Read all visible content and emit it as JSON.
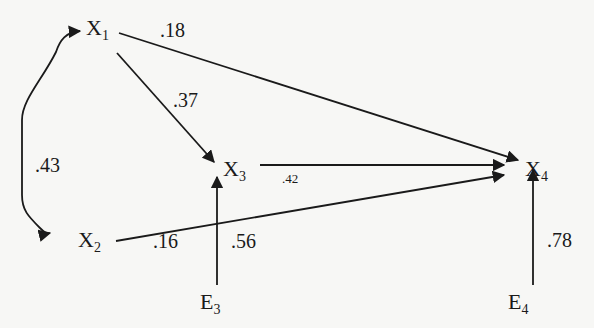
{
  "diagram": {
    "type": "path-diagram",
    "nodes": [
      {
        "id": "X1",
        "base": "X",
        "sub": "1"
      },
      {
        "id": "X2",
        "base": "X",
        "sub": "2"
      },
      {
        "id": "X3",
        "base": "X",
        "sub": "3"
      },
      {
        "id": "X4",
        "base": "X",
        "sub": "4"
      },
      {
        "id": "E3",
        "base": "E",
        "sub": "3"
      },
      {
        "id": "E4",
        "base": "E",
        "sub": "4"
      }
    ],
    "edges": [
      {
        "from": "X1",
        "to": "X2",
        "kind": "correlation",
        "coef": ".43"
      },
      {
        "from": "X1",
        "to": "X4",
        "kind": "path",
        "coef": ".18"
      },
      {
        "from": "X1",
        "to": "X3",
        "kind": "path",
        "coef": ".37"
      },
      {
        "from": "X3",
        "to": "X4",
        "kind": "path",
        "coef": ".42"
      },
      {
        "from": "X2",
        "to": "X4",
        "kind": "path",
        "coef": ".16"
      },
      {
        "from": "E3",
        "to": "X3",
        "kind": "error",
        "coef": ".56"
      },
      {
        "from": "E4",
        "to": "X4",
        "kind": "error",
        "coef": ".78"
      }
    ]
  }
}
